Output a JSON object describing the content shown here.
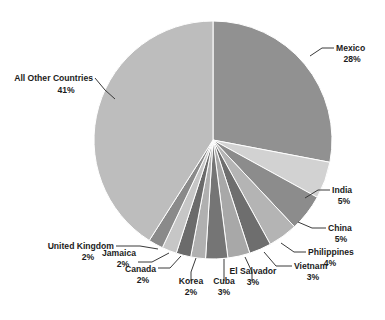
{
  "chart_data": {
    "type": "pie",
    "title": "",
    "subtitle": "",
    "xlabel": "",
    "ylabel": "",
    "legend_position": "none",
    "grid": false,
    "start_angle_deg": 0,
    "direction": "clockwise",
    "value_unit": "%",
    "categories": [
      "Mexico",
      "India",
      "China",
      "Philippines",
      "Vietnam",
      "El Salvador",
      "Cuba",
      "Korea",
      "Canada",
      "Jamaica",
      "United Kingdom",
      "All Other Countries"
    ],
    "values": [
      28,
      5,
      5,
      4,
      3,
      3,
      3,
      2,
      2,
      2,
      2,
      41
    ],
    "labels": [
      "Mexico 28%",
      "India 5%",
      "China 5%",
      "Philippines 4%",
      "Vietnam 3%",
      "El Salvador 3%",
      "Cuba 3%",
      "Korea 2%",
      "Canada 2%",
      "Jamaica 2%",
      "United Kingdom 2%",
      "All Other Countries 41%"
    ],
    "slices": [
      {
        "name": "Mexico",
        "value": 28,
        "pct_text": "28%",
        "color": "#919191"
      },
      {
        "name": "India",
        "value": 5,
        "pct_text": "5%",
        "color": "#d2d2d2"
      },
      {
        "name": "China",
        "value": 5,
        "pct_text": "5%",
        "color": "#8c8c8c"
      },
      {
        "name": "Philippines",
        "value": 4,
        "pct_text": "4%",
        "color": "#b4b4b4"
      },
      {
        "name": "Vietnam",
        "value": 3,
        "pct_text": "3%",
        "color": "#6e6e6e"
      },
      {
        "name": "El Salvador",
        "value": 3,
        "pct_text": "3%",
        "color": "#a8a8a8"
      },
      {
        "name": "Cuba",
        "value": 3,
        "pct_text": "3%",
        "color": "#757575"
      },
      {
        "name": "Korea",
        "value": 2,
        "pct_text": "2%",
        "color": "#b0b0b0"
      },
      {
        "name": "Canada",
        "value": 2,
        "pct_text": "2%",
        "color": "#6b6b6b"
      },
      {
        "name": "Jamaica",
        "value": 2,
        "pct_text": "2%",
        "color": "#c6c6c6"
      },
      {
        "name": "United Kingdom",
        "value": 2,
        "pct_text": "2%",
        "color": "#8a8a8a"
      },
      {
        "name": "All Other Countries",
        "value": 41,
        "pct_text": "41%",
        "color": "#bdbdbd"
      }
    ]
  },
  "labels": {
    "mexico": {
      "name": "Mexico",
      "pct": "28%"
    },
    "india": {
      "name": "India",
      "pct": "5%"
    },
    "china": {
      "name": "China",
      "pct": "5%"
    },
    "philippines": {
      "name": "Philippines",
      "pct": "4%"
    },
    "vietnam": {
      "name": "Vietnam",
      "pct": "3%"
    },
    "el_salvador": {
      "name": "El Salvador",
      "pct": "3%"
    },
    "cuba": {
      "name": "Cuba",
      "pct": "3%"
    },
    "korea": {
      "name": "Korea",
      "pct": "2%"
    },
    "canada": {
      "name": "Canada",
      "pct": "2%"
    },
    "jamaica": {
      "name": "Jamaica",
      "pct": "2%"
    },
    "united_kingdom": {
      "name": "United Kingdom",
      "pct": "2%"
    },
    "all_other": {
      "name": "All Other Countries",
      "pct": "41%"
    }
  },
  "colors": {
    "background": "#ffffff",
    "text": "#1c1c1c",
    "leader_line": "#3a3a3a",
    "slice_border": "#ffffff"
  }
}
